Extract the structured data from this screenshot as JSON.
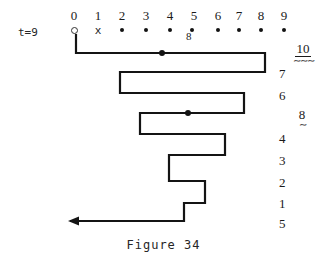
{
  "figure": {
    "caption": "Figure 34",
    "time_label": "t=9"
  },
  "tape": {
    "column_headers": [
      "0",
      "1",
      "2",
      "3",
      "4",
      "5",
      "6",
      "7",
      "8",
      "9"
    ],
    "cell_markers": [
      {
        "column": "0",
        "glyph": "ring",
        "icon": "open-circle-icon"
      },
      {
        "column": "1",
        "glyph": "x",
        "icon": "x-mark-icon"
      },
      {
        "column": "2",
        "glyph": "dot",
        "icon": "filled-dot-icon"
      },
      {
        "column": "3",
        "glyph": "dot",
        "icon": "filled-dot-icon"
      },
      {
        "column": "4",
        "glyph": "dot",
        "icon": "filled-dot-icon"
      },
      {
        "column": "5",
        "glyph": "dot",
        "icon": "filled-dot-icon"
      },
      {
        "column": "6",
        "glyph": "dot",
        "icon": "filled-dot-icon"
      },
      {
        "column": "7",
        "glyph": "dot",
        "icon": "filled-dot-icon"
      },
      {
        "column": "8",
        "glyph": "dot",
        "icon": "filled-dot-icon"
      },
      {
        "column": "9",
        "glyph": "dot",
        "icon": "filled-dot-icon"
      }
    ],
    "subscript_annotation": "8"
  },
  "row_labels": [
    {
      "text": "10",
      "underlined": true,
      "squiggle": "double"
    },
    {
      "text": "7",
      "underlined": false,
      "squiggle": "none"
    },
    {
      "text": "6",
      "underlined": false,
      "squiggle": "none"
    },
    {
      "text": "8",
      "underlined": false,
      "squiggle": "single"
    },
    {
      "text": "4",
      "underlined": false,
      "squiggle": "none"
    },
    {
      "text": "3",
      "underlined": false,
      "squiggle": "none"
    },
    {
      "text": "2",
      "underlined": false,
      "squiggle": "none"
    },
    {
      "text": "1",
      "underlined": false,
      "squiggle": "none"
    },
    {
      "text": "5",
      "underlined": false,
      "squiggle": "none"
    }
  ],
  "path": {
    "stroke_color": "#141414",
    "stroke_width": 2.2,
    "polyline": "76,34 76,53 265,53 265,72 120,72 120,93 244,93 244,113 140,113 140,134 225,134 225,155 169,155 169,181 205,181 205,203 184,203 184,221 70,221",
    "node_dots": [
      {
        "x": 162,
        "y": 53
      },
      {
        "x": 188,
        "y": 113
      }
    ],
    "arrow_head": {
      "x": 68,
      "y": 221,
      "direction": "left"
    }
  },
  "colors": {
    "ink": "#141414",
    "background": "#ffffff"
  }
}
